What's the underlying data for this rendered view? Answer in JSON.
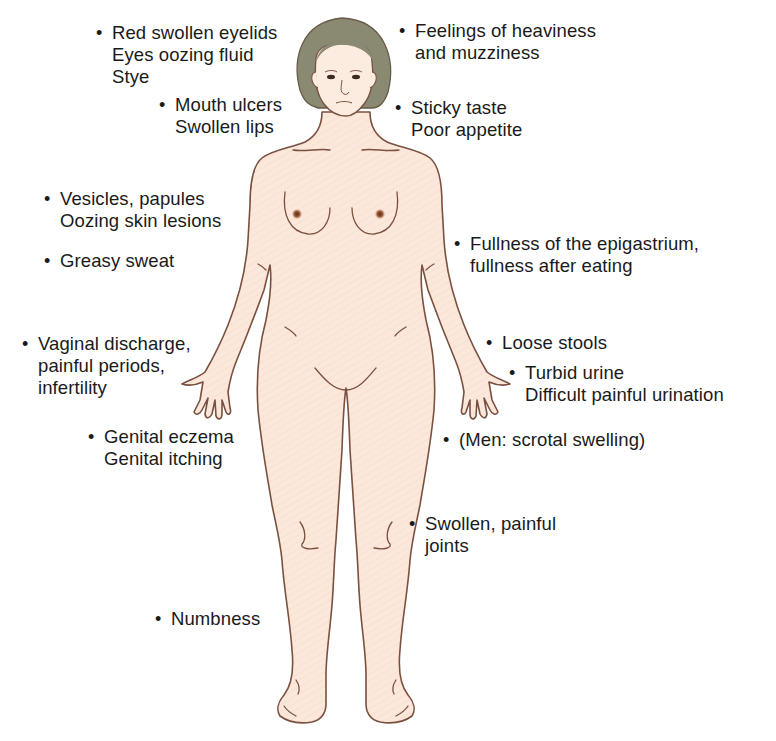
{
  "diagram": {
    "colors": {
      "skin": "#fbe9dc",
      "outline": "#7a5040",
      "hair": "#8a8a72",
      "nipple": "#8a4a2e",
      "text": "#1a1a1a",
      "background": "#ffffff"
    },
    "labels": [
      {
        "id": "eyes",
        "lines": [
          "Red swollen eyelids",
          "Eyes oozing fluid",
          "Stye"
        ]
      },
      {
        "id": "head",
        "lines": [
          "Feelings of heaviness",
          "and muzziness"
        ]
      },
      {
        "id": "mouth",
        "lines": [
          "Mouth ulcers",
          "Swollen lips"
        ]
      },
      {
        "id": "taste",
        "lines": [
          "Sticky taste",
          "Poor appetite"
        ]
      },
      {
        "id": "skin",
        "lines": [
          "Vesicles, papules",
          "Oozing skin lesions"
        ]
      },
      {
        "id": "sweat",
        "lines": [
          "Greasy sweat"
        ]
      },
      {
        "id": "epigastrium",
        "lines": [
          "Fullness of the epigastrium,",
          "fullness after eating"
        ]
      },
      {
        "id": "gynecologic",
        "lines": [
          "Vaginal discharge,",
          "painful periods,",
          "infertility"
        ]
      },
      {
        "id": "stools",
        "lines": [
          "Loose stools"
        ]
      },
      {
        "id": "urine",
        "lines": [
          "Turbid urine",
          "Difficult painful urination"
        ]
      },
      {
        "id": "genital",
        "lines": [
          "Genital eczema",
          "Genital itching"
        ]
      },
      {
        "id": "scrotal",
        "lines": [
          "(Men: scrotal swelling)"
        ]
      },
      {
        "id": "joints",
        "lines": [
          "Swollen, painful",
          "joints"
        ]
      },
      {
        "id": "numbness",
        "lines": [
          "Numbness"
        ]
      }
    ],
    "bullet_glyph": "•"
  }
}
